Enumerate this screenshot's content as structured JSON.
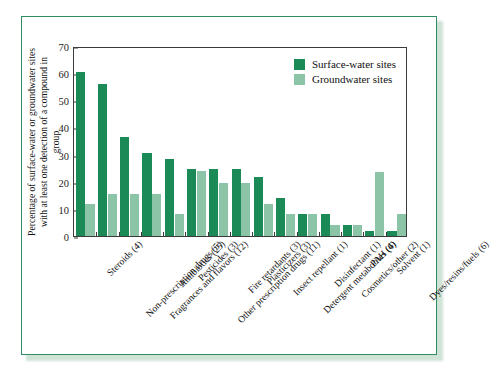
{
  "chart_data": {
    "type": "bar",
    "title": "",
    "xlabel": "",
    "ylabel": "Percentage of surface-water or groundwater sites with at least one detection of a compound in group",
    "ylabel_line1": "Percentage of surface-water or groundwater sites",
    "ylabel_line2": "with at least one detection of a compound in group",
    "ylim": [
      0,
      70
    ],
    "yticks": [
      0,
      10,
      20,
      30,
      40,
      50,
      60,
      70
    ],
    "grid": false,
    "legend_position": "top-right",
    "categories": [
      "Steroids (4)",
      "Non-prescription drugs (5)",
      "Fragrances and flavors (12)",
      "Antibiotics (25)",
      "Pesticides (3)",
      "Other prescription drugs (11)",
      "Fire retardants (3)",
      "Plasticizers (3)",
      "Insect repellant (1)",
      "Detergent metabolites (4)",
      "Disinfectant (1)",
      "Cosmetics/other (2)",
      "PAH (6)",
      "Solvent (1)",
      "Dyes/resins/fuels (6)"
    ],
    "series": [
      {
        "name": "Surface-water sites",
        "color": "#1c8a57",
        "values": [
          60.5,
          56,
          36.5,
          30.5,
          28.5,
          24.7,
          24.7,
          24.7,
          21.6,
          14,
          8,
          8,
          4,
          2,
          2
        ]
      },
      {
        "name": "Groundwater sites",
        "color": "#8cc4a8",
        "values": [
          11.8,
          15.6,
          15.6,
          15.6,
          8,
          23.8,
          19.7,
          19.7,
          11.8,
          8,
          8,
          4,
          4,
          23.5,
          8
        ]
      }
    ]
  },
  "legend": {
    "items": [
      {
        "label": "Surface-water sites",
        "color": "#1c8a57"
      },
      {
        "label": "Groundwater sites",
        "color": "#8cc4a8"
      }
    ]
  },
  "frame": {
    "border_color": "#2e8b62",
    "background": "#ffffff"
  }
}
